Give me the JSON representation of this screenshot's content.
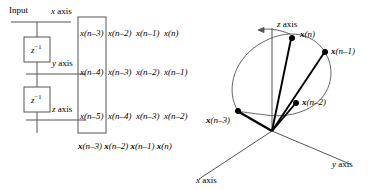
{
  "figure": {
    "background_color": "#ffffff",
    "line_color": "#555555",
    "vector_color": "#000000"
  },
  "delay_line": {
    "input_label": "Input",
    "taps": [
      {
        "id": "x-axis-tap",
        "label_plain": "x",
        "label_suffix": " axis"
      },
      {
        "id": "y-axis-tap",
        "label_plain": "y",
        "label_suffix": " axis"
      },
      {
        "id": "z-axis-tap",
        "label_plain": "z",
        "label_suffix": " axis"
      }
    ],
    "delay_blocks": [
      {
        "id": "delay-block-1",
        "base": "z",
        "exponent": "−1"
      },
      {
        "id": "delay-block-2",
        "base": "z",
        "exponent": "−1"
      }
    ]
  },
  "matrix": {
    "bracket_style": "box",
    "rows": [
      {
        "id": "matrix-row-x",
        "inside": "x(n–3)",
        "outside": [
          "x(n–2)",
          "x(n–1)",
          "x(n)"
        ]
      },
      {
        "id": "matrix-row-y",
        "inside": "x(n–4)",
        "outside": [
          "x(n–3)",
          "x(n–2)",
          "x(n–1)"
        ]
      },
      {
        "id": "matrix-row-z",
        "inside": "x(n–5)",
        "outside": [
          "x(n–4)",
          "x(n–3)",
          "x(n–2)"
        ]
      }
    ],
    "column_caption": [
      {
        "bold": "x",
        "arg": "(n–3)"
      },
      {
        "bold": "x",
        "arg": "(n–2)"
      },
      {
        "bold": "x",
        "arg": "(n–1)"
      },
      {
        "bold": "x",
        "arg": "(n)"
      }
    ]
  },
  "plot3d": {
    "axes": [
      {
        "id": "axis-z",
        "var": "z",
        "suffix": " axis"
      },
      {
        "id": "axis-y",
        "var": "y",
        "suffix": " axis"
      },
      {
        "id": "axis-x",
        "var": "x",
        "suffix": " axis"
      }
    ],
    "origin": {
      "x": 272,
      "y": 131
    },
    "vectors": [
      {
        "id": "vector-x-n-3",
        "bold": "x",
        "arg": "(n–3)",
        "tip": {
          "x": 238,
          "y": 111
        }
      },
      {
        "id": "vector-x-n-2",
        "bold": "x",
        "arg": "(n–2)",
        "tip": {
          "x": 296,
          "y": 103
        }
      },
      {
        "id": "vector-x-n-1",
        "bold": "x",
        "arg": "(n–1)",
        "tip": {
          "x": 325,
          "y": 52
        }
      },
      {
        "id": "vector-x-n",
        "bold": "x",
        "arg": "(n)",
        "tip": {
          "x": 292,
          "y": 38
        }
      }
    ],
    "trajectory_note": "closed loop curve threading the four vector tips",
    "arrow_annotation": {
      "id": "trajectory-direction-arrow",
      "from": {
        "x": 290,
        "y": 34
      },
      "to": {
        "x": 258,
        "y": 30
      }
    }
  }
}
